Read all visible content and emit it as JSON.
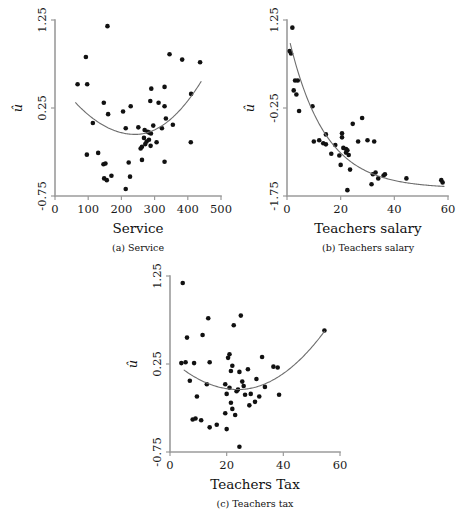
{
  "figure": {
    "background": "#ffffff",
    "point_color": "#111111",
    "curve_color": "#6e6e6e",
    "axis_color": "#9b9b9b",
    "y_symbol": "û"
  },
  "chart_data": [
    {
      "type": "scatter",
      "panel_id": "a",
      "caption": "(a) Service",
      "title": "",
      "xlabel": "Service",
      "ylabel": "û",
      "xlim": [
        0,
        500
      ],
      "ylim": [
        -0.75,
        1.25
      ],
      "xticks": [
        0,
        100,
        200,
        300,
        400,
        500
      ],
      "xticklabels": [
        "0",
        "100",
        "200",
        "300",
        "400",
        "500"
      ],
      "yticks": [
        -0.75,
        0.25,
        1.25
      ],
      "yticklabels": [
        "-0.75",
        "0.25",
        "1.25"
      ],
      "grid": false,
      "legend": "none",
      "x": [
        158,
        93,
        345,
        383,
        437,
        68,
        97,
        330,
        410,
        290,
        147,
        287,
        312,
        205,
        228,
        330,
        114,
        160,
        334,
        251,
        296,
        213,
        355,
        270,
        279,
        284,
        289,
        268,
        276,
        283,
        322,
        272,
        262,
        258,
        288,
        306,
        409,
        96,
        130,
        146,
        152,
        222,
        262,
        330,
        170,
        213,
        226,
        148,
        156
      ],
      "y": [
        1.18,
        0.83,
        0.86,
        0.8,
        0.77,
        0.52,
        0.52,
        0.49,
        0.41,
        0.47,
        0.31,
        0.33,
        0.31,
        0.21,
        0.27,
        0.27,
        0.08,
        0.18,
        0.13,
        0.03,
        0.05,
        0.02,
        0.06,
        0.0,
        -0.02,
        -0.03,
        -0.04,
        -0.09,
        -0.13,
        -0.11,
        0.02,
        -0.16,
        -0.19,
        -0.21,
        -0.18,
        -0.14,
        -0.14,
        -0.28,
        -0.26,
        -0.39,
        -0.38,
        -0.37,
        -0.34,
        -0.36,
        -0.52,
        -0.67,
        -0.53,
        -0.55,
        -0.57
      ],
      "fit": {
        "type": "quadratic-smooth",
        "x_start": 62,
        "x_end": 440,
        "vertex_x": 242,
        "vertex_y": -0.05,
        "y_start": 0.31,
        "y_end": 0.55
      }
    },
    {
      "type": "scatter",
      "panel_id": "b",
      "caption": "(b) Teachers salary",
      "title": "",
      "xlabel": "Teachers salary",
      "ylabel": "û",
      "xlim": [
        0,
        60
      ],
      "ylim": [
        -1.75,
        1.25
      ],
      "xticks": [
        0,
        20,
        40,
        60
      ],
      "xticklabels": [
        "0",
        "20",
        "40",
        "60"
      ],
      "yticks": [
        -1.75,
        -0.25,
        1.25
      ],
      "yticklabels": [
        "-1.75",
        "-0.25",
        "1.25"
      ],
      "grid": false,
      "legend": "none",
      "x": [
        2.0,
        1.0,
        1.5,
        3.0,
        4.0,
        2.5,
        3.5,
        9.5,
        4.5,
        24.5,
        28.0,
        14.5,
        20.5,
        20.5,
        10.0,
        12.0,
        26.5,
        30.0,
        32.5,
        13.5,
        14.5,
        18.0,
        21.0,
        22.0,
        22.5,
        22.0,
        16.5,
        19.5,
        23.0,
        20.0,
        23.5,
        32.0,
        33.0,
        36.0,
        36.5,
        34.0,
        31.5,
        44.5,
        57.5,
        58.0,
        22.5
      ],
      "y": [
        1.12,
        0.72,
        0.68,
        0.22,
        0.22,
        0.05,
        -0.02,
        -0.22,
        -0.3,
        -0.52,
        -0.42,
        -0.7,
        -0.68,
        -0.75,
        -0.82,
        -0.8,
        -0.82,
        -0.8,
        -0.82,
        -0.85,
        -0.87,
        -0.88,
        -0.93,
        -0.95,
        -0.97,
        -1.01,
        -1.03,
        -1.06,
        -1.05,
        -1.22,
        -1.3,
        -1.38,
        -1.35,
        -1.4,
        -1.38,
        -1.45,
        -1.55,
        -1.45,
        -1.48,
        -1.52,
        -1.65
      ],
      "fit": {
        "type": "exponential-decay",
        "x_start": 1.2,
        "x_end": 58.5,
        "y_start": 0.85,
        "y_end": -1.5,
        "asymptote": -1.62,
        "decay": 0.075
      }
    },
    {
      "type": "scatter",
      "panel_id": "c",
      "caption": "(c) Teachers tax",
      "title": "",
      "xlabel": "Teachers Tax",
      "ylabel": "û",
      "xlim": [
        0,
        60
      ],
      "ylim": [
        -0.75,
        1.25
      ],
      "xticks": [
        0,
        20,
        40,
        60
      ],
      "xticklabels": [
        "0",
        "20",
        "40",
        "60"
      ],
      "yticks": [
        -0.75,
        0.25,
        1.25
      ],
      "yticklabels": [
        "-0.75",
        "0.25",
        "1.25"
      ],
      "grid": false,
      "legend": "none",
      "x": [
        4.5,
        13.5,
        22.5,
        25.0,
        6.0,
        11.5,
        54.5,
        8.5,
        14.0,
        21.0,
        32.5,
        20.5,
        36.5,
        4.0,
        5.5,
        22.0,
        21.5,
        27.5,
        24.5,
        38.0,
        30.5,
        7.0,
        13.0,
        25.5,
        19.5,
        21.0,
        26.0,
        24.0,
        33.5,
        9.5,
        20.0,
        23.5,
        26.5,
        28.5,
        31.5,
        38.5,
        21.5,
        28.0,
        30.0,
        22.0,
        8.0,
        9.0,
        11.0,
        19.5,
        23.0,
        14.0,
        16.5,
        20.0,
        24.5
      ],
      "y": [
        1.17,
        0.77,
        0.69,
        0.8,
        0.55,
        0.58,
        0.63,
        0.26,
        0.27,
        0.36,
        0.33,
        0.32,
        0.22,
        0.26,
        0.27,
        0.23,
        0.17,
        0.19,
        0.16,
        0.21,
        0.08,
        0.06,
        0.02,
        0.05,
        0.02,
        -0.02,
        0.0,
        -0.04,
        -0.01,
        -0.12,
        -0.09,
        -0.06,
        -0.1,
        -0.09,
        -0.12,
        -0.1,
        -0.19,
        -0.22,
        -0.18,
        -0.26,
        -0.38,
        -0.37,
        -0.39,
        -0.31,
        -0.33,
        -0.47,
        -0.44,
        -0.49,
        -0.69
      ],
      "fit": {
        "type": "quadratic-smooth",
        "x_start": 5.0,
        "x_end": 54.5,
        "vertex_x": 24.0,
        "vertex_y": -0.04,
        "y_start": 0.18,
        "y_end": 0.62
      }
    }
  ]
}
